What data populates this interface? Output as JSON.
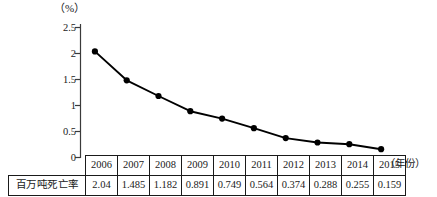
{
  "chart_data": {
    "type": "line",
    "title": "",
    "subtitle": "",
    "xlabel": "（年份）",
    "ylabel": "（%）",
    "categories": [
      "2006",
      "2007",
      "2008",
      "2009",
      "2010",
      "2011",
      "2012",
      "2013",
      "2014",
      "2015"
    ],
    "series": [
      {
        "name": "百万吨死亡率",
        "values": [
          2.04,
          1.485,
          1.182,
          0.891,
          0.749,
          0.564,
          0.374,
          0.288,
          0.255,
          0.159
        ]
      }
    ],
    "values": [
      2.04,
      1.485,
      1.182,
      0.891,
      0.749,
      0.564,
      0.374,
      0.288,
      0.255,
      0.159
    ],
    "ylim": [
      0,
      2.5
    ],
    "ytick_labels": [
      "0",
      "0.5",
      "1",
      "1.5",
      "2",
      "2.5"
    ],
    "ytick_values": [
      0,
      0.5,
      1,
      1.5,
      2,
      2.5
    ],
    "grid": false,
    "legend": "none",
    "marker": "filled-circle",
    "line_color": "#000000",
    "marker_color": "#000000",
    "axis_color": "#3a3a3a"
  },
  "axis": {
    "unit_label": "（%）",
    "x_caption": "（年份）",
    "y_ticks": [
      "2.5",
      "2",
      "1.5",
      "1",
      "0.5",
      "0"
    ]
  },
  "table": {
    "row_label": "百万吨死亡率",
    "years": [
      "2006",
      "2007",
      "2008",
      "2009",
      "2010",
      "2011",
      "2012",
      "2013",
      "2014",
      "2015"
    ],
    "values": [
      "2.04",
      "1.485",
      "1.182",
      "0.891",
      "0.749",
      "0.564",
      "0.374",
      "0.288",
      "0.255",
      "0.159"
    ]
  }
}
